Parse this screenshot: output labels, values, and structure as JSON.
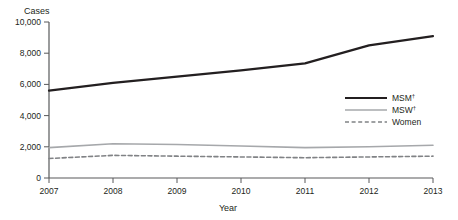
{
  "chart_data": {
    "type": "line",
    "title": "",
    "xlabel": "Year",
    "ylabel": "Cases",
    "categories": [
      2007,
      2008,
      2009,
      2010,
      2011,
      2012,
      2013
    ],
    "x": [
      2007,
      2008,
      2009,
      2010,
      2011,
      2012,
      2013
    ],
    "xlim": [
      2007,
      2013
    ],
    "ylim": [
      0,
      10000
    ],
    "yticks": [
      0,
      2000,
      4000,
      6000,
      8000,
      10000
    ],
    "ytick_labels": [
      "0",
      "2,000",
      "4,000",
      "6,000",
      "8,000",
      "10,000"
    ],
    "xtick_labels": [
      "2007",
      "2008",
      "2009",
      "2010",
      "2011",
      "2012",
      "2013"
    ],
    "grid": false,
    "legend_position": "right",
    "series": [
      {
        "name": "MSM",
        "name_display": "MSM",
        "footnote_marker": "†",
        "style": "solid",
        "color": "#231f20",
        "width": 2.2,
        "values": [
          5600,
          6100,
          6500,
          6900,
          7350,
          8500,
          9100
        ]
      },
      {
        "name": "MSW",
        "name_display": "MSW",
        "footnote_marker": "†",
        "style": "solid",
        "color": "#a6a8ab",
        "width": 1.6,
        "values": [
          1950,
          2200,
          2150,
          2050,
          1950,
          2000,
          2100
        ]
      },
      {
        "name": "Women",
        "name_display": "Women",
        "footnote_marker": "",
        "style": "dashed",
        "color": "#808285",
        "width": 1.6,
        "values": [
          1250,
          1450,
          1400,
          1350,
          1300,
          1350,
          1400
        ]
      }
    ]
  },
  "legend": {
    "items": [
      {
        "label": "MSM",
        "marker": "†",
        "key": "msm"
      },
      {
        "label": "MSW",
        "marker": "†",
        "key": "msw"
      },
      {
        "label": "Women",
        "marker": "",
        "key": "women"
      }
    ]
  },
  "axes": {
    "y_title": "Cases",
    "x_title": "Year"
  }
}
